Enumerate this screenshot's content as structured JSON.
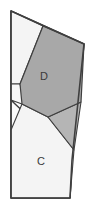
{
  "figure": {
    "canvas": {
      "width": 92,
      "height": 212,
      "background": "#ffffff"
    },
    "palette": {
      "outline": "#3f3f3f",
      "dark_fill": "#a8a8a8",
      "mid_fill": "#b5b5b5",
      "light_fill": "#f4f4f4",
      "pale_fill": "#ececec",
      "label_color": "#3a3a3a"
    },
    "outer_boundary": {
      "name": "outer-polygon",
      "points": "11,11 84,44 72,160 70,198 11,198",
      "fill": "#fbfbfb",
      "stroke": "#3f3f3f"
    },
    "regions": [
      {
        "id": "region-upper-left-pale",
        "label": "",
        "points": "11,11 43,26 20,84 11,84",
        "fill": "#f4f4f4",
        "stroke": "#3f3f3f"
      },
      {
        "id": "region-left-sliver",
        "label": "",
        "points": "11,84 20,84 30,118 11,100",
        "fill": "#f7f7f7",
        "stroke": "#3f3f3f"
      },
      {
        "id": "region-d",
        "label": "D",
        "label_x": 44,
        "label_y": 77,
        "points": "43,26 84,44 81,102 48,117 22,104 20,84",
        "fill": "#a8a8a8",
        "stroke": "#3f3f3f"
      },
      {
        "id": "region-right-triangle",
        "label": "",
        "points": "81,102 74,150 48,117",
        "fill": "#b5b5b5",
        "stroke": "#3f3f3f"
      },
      {
        "id": "region-c",
        "label": "C",
        "label_x": 41,
        "label_y": 162,
        "points": "22,104 48,117 74,150 70,198 11,198 11,130",
        "fill": "#f4f4f4",
        "stroke": "#3f3f3f"
      },
      {
        "id": "region-mid-left-wedge",
        "label": "",
        "points": "11,100 30,118 22,104",
        "fill": "#fafafa",
        "stroke": "#3f3f3f"
      }
    ],
    "labels": [
      {
        "id": "label-d",
        "text": "D",
        "x": 44,
        "y": 77
      },
      {
        "id": "label-c",
        "text": "C",
        "x": 41,
        "y": 162
      }
    ]
  }
}
